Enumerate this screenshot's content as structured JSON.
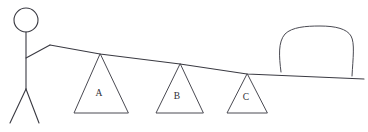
{
  "scene": {
    "title": "Lever and fulcrum diagram",
    "background_color": "#ffffff",
    "stroke_color": "#3a3a42",
    "width": 368,
    "height": 132
  },
  "person": {
    "name": "stick-figure",
    "description": "Stick figure standing at left end lifting the plank",
    "head": {
      "cx": 26,
      "cy": 20,
      "r": 12
    },
    "body": {
      "x1": 26,
      "y1": 32,
      "x2": 26,
      "y2": 89
    },
    "arm": "M26,58 L50,45 L57,45",
    "leg_left": {
      "x1": 26,
      "y1": 89,
      "x2": 10,
      "y2": 123
    },
    "leg_right": {
      "x1": 26,
      "y1": 89,
      "x2": 39,
      "y2": 123
    }
  },
  "plank": {
    "name": "lever-plank",
    "description": "Long board sloping down to the right",
    "path": "M50,45 L100,54 L180,64 L247,74 L364,79",
    "left_end": [
      50,
      45
    ],
    "right_end": [
      364,
      79
    ]
  },
  "fulcrums": [
    {
      "label": "A",
      "apex": [
        100,
        54
      ],
      "base_left": [
        74,
        113
      ],
      "base_right": [
        128,
        113
      ],
      "label_x": 99,
      "label_y": 94
    },
    {
      "label": "B",
      "apex": [
        180,
        64
      ],
      "base_left": [
        156,
        113
      ],
      "base_right": [
        203,
        113
      ],
      "label_x": 177,
      "label_y": 97
    },
    {
      "label": "C",
      "apex": [
        247,
        74
      ],
      "base_left": [
        227,
        113
      ],
      "base_right": [
        267,
        113
      ],
      "label_x": 246,
      "label_y": 98
    }
  ],
  "load": {
    "name": "boulder",
    "description": "Large rounded rock resting on the right end of the plank",
    "outline": "M281,72 C279,56 278,42 285,34 C292,27 306,26 320,26 C336,26 347,29 351,36 C355,43 353,58 352,76"
  }
}
